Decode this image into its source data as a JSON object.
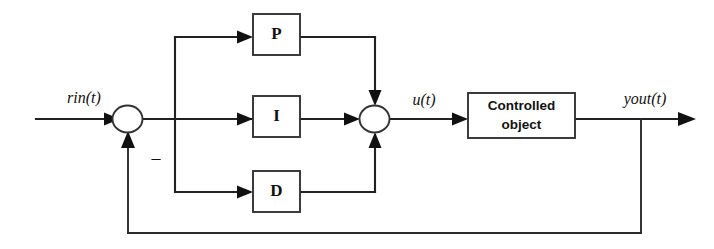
{
  "diagram": {
    "type": "block-diagram",
    "background_color": "#ffffff",
    "line_color": "#222222",
    "text_color": "#111111",
    "blocks": [
      {
        "id": "p",
        "label": "P",
        "role": "proportional-gain-block"
      },
      {
        "id": "i",
        "label": "I",
        "role": "integral-gain-block"
      },
      {
        "id": "d",
        "label": "D",
        "role": "derivative-gain-block"
      },
      {
        "id": "plant",
        "label_line1": "Controlled",
        "label_line2": "object",
        "role": "plant-block"
      }
    ],
    "junctions": [
      {
        "id": "error-sum",
        "role": "error-summing-junction"
      },
      {
        "id": "control-sum",
        "role": "pid-output-summing-junction"
      }
    ],
    "signals": {
      "reference": "rin(t)",
      "control": "u(t)",
      "output": "yout(t)",
      "feedback_sign": "–"
    }
  }
}
